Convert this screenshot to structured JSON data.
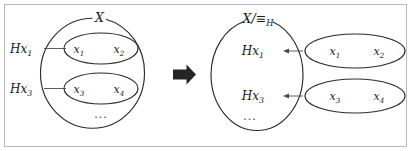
{
  "figure": {
    "width": 411,
    "height": 151,
    "background_color": "#ffffff",
    "frame_color": "#b9b9b9",
    "stroke_color": "#2b2b2b",
    "connector_color": "#4a4a4a",
    "arrow_color": "#242424"
  },
  "left_panel": {
    "outer_set_label": "X",
    "outer_set_name": "set-x",
    "cosets": [
      {
        "label": "Hx",
        "label_sub": "1",
        "elements": [
          {
            "label": "x",
            "sub": "1"
          },
          {
            "label": "x",
            "sub": "2"
          }
        ]
      },
      {
        "label": "Hx",
        "label_sub": "3",
        "elements": [
          {
            "label": "x",
            "sub": "3"
          },
          {
            "label": "x",
            "sub": "4"
          }
        ]
      }
    ],
    "ellipsis": "..."
  },
  "transform_arrow": {
    "name": "rightwards-arrow",
    "direction": "right"
  },
  "right_panel": {
    "outer_set_label": "X/≡",
    "outer_set_label_sub": "H",
    "outer_set_name": "quotient-set-x-mod-h",
    "classes": [
      {
        "label": "Hx",
        "label_sub": "1",
        "elements": [
          {
            "label": "x",
            "sub": "1"
          },
          {
            "label": "x",
            "sub": "2"
          }
        ]
      },
      {
        "label": "Hx",
        "label_sub": "3",
        "elements": [
          {
            "label": "x",
            "sub": "3"
          },
          {
            "label": "x",
            "sub": "4"
          }
        ]
      }
    ],
    "ellipsis": "..."
  }
}
